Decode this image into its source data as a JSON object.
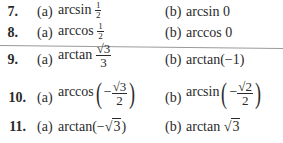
{
  "problems": [
    {
      "number": "7.",
      "a": {
        "label": "(a)",
        "func": "arcsin",
        "num": "1",
        "den": "2"
      },
      "b": {
        "label": "(b)",
        "text": "arcsin 0"
      }
    },
    {
      "number": "8.",
      "a": {
        "label": "(a)",
        "func": "arccos",
        "num": "1",
        "den": "2"
      },
      "b": {
        "label": "(b)",
        "text": "arccos 0"
      }
    },
    {
      "number": "9.",
      "a": {
        "label": "(a)",
        "func": "arctan",
        "num": "√3",
        "den": "3"
      },
      "b": {
        "label": "(b)",
        "text": "arctan(−1)"
      }
    },
    {
      "number": "10.",
      "a": {
        "label": "(a)",
        "func": "arccos",
        "sign": "−",
        "num": "√3",
        "den": "2"
      },
      "b": {
        "label": "(b)",
        "func": "arcsin",
        "sign": "−",
        "num": "√2",
        "den": "2"
      }
    },
    {
      "number": "11.",
      "a": {
        "label": "(a)",
        "func": "arctan",
        "open": "(−",
        "rad": "3",
        "close": ")"
      },
      "b": {
        "label": "(b)",
        "func": "arctan",
        "rad": "3"
      }
    }
  ]
}
